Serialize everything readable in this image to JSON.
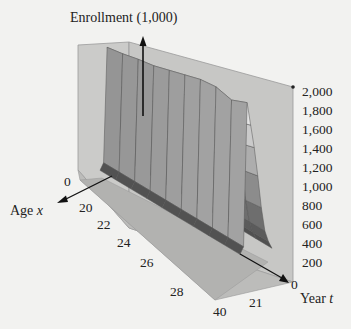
{
  "chart_data": {
    "type": "surface3d",
    "title": "",
    "zlabel": "Enrollment (1,000)",
    "xlabel": "Age x",
    "ylabel": "Year t",
    "x_axis": {
      "name": "Age",
      "var": "x",
      "ticks": [
        "0",
        "20",
        "22",
        "24",
        "26",
        "28",
        "40"
      ],
      "range": [
        0,
        40
      ]
    },
    "t_axis": {
      "name": "Year",
      "var": "t",
      "ticks": [
        "0",
        "21"
      ],
      "range": [
        0,
        21
      ]
    },
    "z_axis": {
      "ticks": [
        "2,000",
        "1,800",
        "1,600",
        "1,400",
        "1,200",
        "1,000",
        "800",
        "600",
        "400",
        "200",
        "0"
      ],
      "range": [
        0,
        2000
      ]
    },
    "grid_rows": 10,
    "grid_cols": 10,
    "surface_profile_by_age": {
      "age": [
        0,
        18,
        19,
        20,
        21,
        22,
        24,
        26,
        28,
        40
      ],
      "enrollment_approx": [
        80,
        150,
        1350,
        1150,
        950,
        700,
        420,
        260,
        140,
        60
      ]
    },
    "surface_max_by_year_approx": [
      1350,
      1380,
      1420,
      1450,
      1500,
      1550,
      1600,
      1620,
      1580,
      1650
    ],
    "colors": {
      "background": "#f2f2f0",
      "wall": "#c9c9c7",
      "wall_light": "#d6d6d4",
      "floor": "#bdbdbb",
      "surface_low": "#4a4a4a",
      "surface_high": "#f4f4f4",
      "axis": "#111111"
    }
  },
  "labels": {
    "z_axis_title": "Enrollment (1,000)",
    "x_axis_title": "Age ",
    "x_axis_var": "x",
    "t_axis_title": "Year ",
    "t_axis_var": "t",
    "x_ticks": [
      "0",
      "20",
      "22",
      "24",
      "26",
      "28",
      "40"
    ],
    "t_ticks": [
      "0",
      "21"
    ],
    "z_ticks": [
      "2,000",
      "1,800",
      "1,600",
      "1,400",
      "1,200",
      "1,000",
      "800",
      "600",
      "400",
      "200"
    ]
  }
}
